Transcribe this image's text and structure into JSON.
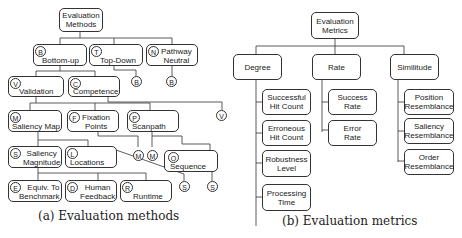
{
  "left": {
    "root": "Evaluation\nMethods",
    "nodes": {
      "bottom_up": {
        "tag": "B",
        "label": "Bottom-up"
      },
      "top_down": {
        "tag": "T",
        "label": "Top-Down"
      },
      "pathway": {
        "tag": "N",
        "label": "Pathway\nNeutral"
      },
      "validation": {
        "tag": "V",
        "label": "Validation"
      },
      "competence": {
        "tag": "C",
        "label": "Competence"
      },
      "saliency_map": {
        "tag": "M",
        "label": "Saliency Map"
      },
      "fixation": {
        "tag": "F",
        "label": "Fixation\nPoints"
      },
      "scanpath": {
        "tag": "P",
        "label": "Scanpath"
      },
      "sal_mag": {
        "tag": "S",
        "label": "Saliency\nMagnitude"
      },
      "locations": {
        "tag": "L",
        "label": "Locations"
      },
      "sequence": {
        "tag": "O",
        "label": "Sequence"
      },
      "equiv": {
        "tag": "E",
        "label": "Equiv. To\nBenchmark"
      },
      "human": {
        "tag": "D",
        "label": "Human\nFeedback"
      },
      "runtime": {
        "tag": "R",
        "label": "Runtime"
      }
    },
    "refs": {
      "td": "B",
      "pn": "B",
      "v": "V",
      "m1": "M",
      "m2": "M",
      "s1": "S",
      "s2": "S"
    },
    "caption": "(a) Evaluation methods"
  },
  "right": {
    "root": "Evaluation\nMetrics",
    "columns": [
      {
        "label": "Degree",
        "items": [
          "Successful\nHit Count",
          "Erroneous\nHit Count",
          "Robustness\nLevel",
          "Processing\nTime"
        ]
      },
      {
        "label": "Rate",
        "items": [
          "Success\nRate",
          "Error\nRate"
        ]
      },
      {
        "label": "Similitude",
        "items": [
          "Position\nResemblance",
          "Saliency\nResemblance",
          "Order\nResemblance"
        ]
      }
    ],
    "caption": "(b) Evaluation metrics"
  }
}
